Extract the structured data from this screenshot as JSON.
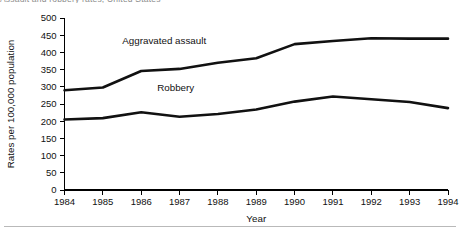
{
  "page": {
    "clipped_caption": "Assault and robbery rates, United States",
    "background_color": "#ffffff",
    "line_color": "#111111",
    "rule_color": "#b9b9b9"
  },
  "chart_data": {
    "type": "line",
    "title": "",
    "xlabel": "Year",
    "ylabel": "Rates per 100,000 population",
    "x": [
      1984,
      1985,
      1986,
      1987,
      1988,
      1989,
      1990,
      1991,
      1992,
      1993,
      1994
    ],
    "xtick_labels": [
      "1984",
      "1985",
      "1986",
      "1987",
      "1988",
      "1989",
      "1990",
      "1991",
      "1992",
      "1993",
      "1994"
    ],
    "ytick_labels": [
      "0",
      "50",
      "100",
      "150",
      "200",
      "250",
      "300",
      "350",
      "400",
      "450",
      "500"
    ],
    "yticks": [
      0,
      50,
      100,
      150,
      200,
      250,
      300,
      350,
      400,
      450,
      500
    ],
    "ylim": [
      0,
      500
    ],
    "grid": false,
    "legend_position": "inline-labels",
    "series": [
      {
        "name": "Aggravated assault",
        "label_x": 1986.6,
        "label_y": 425,
        "values": [
          290,
          298,
          346,
          352,
          370,
          383,
          424,
          433,
          441,
          440,
          440
        ]
      },
      {
        "name": "Robbery",
        "label_x": 1986.9,
        "label_y": 288,
        "values": [
          205,
          209,
          226,
          213,
          221,
          234,
          257,
          272,
          264,
          256,
          238
        ]
      }
    ]
  }
}
